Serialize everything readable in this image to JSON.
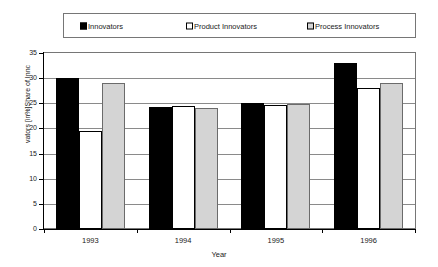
{
  "chart_data": {
    "type": "bar",
    "title": "",
    "xlabel": "Year",
    "ylabel": "vators [in%]Share of Innc",
    "categories": [
      "1993",
      "1994",
      "1995",
      "1996"
    ],
    "series": [
      {
        "name": "Innovators",
        "color": "#000000",
        "values": [
          30.0,
          24.3,
          25.0,
          33.0
        ]
      },
      {
        "name": "Product Innovators",
        "color": "#ffffff",
        "values": [
          19.5,
          24.5,
          24.7,
          28.0
        ]
      },
      {
        "name": "Process Innovators",
        "color": "#d4d4d4",
        "values": [
          29.0,
          24.0,
          24.8,
          29.0
        ]
      }
    ],
    "ylim": [
      0,
      35
    ],
    "yticks": [
      0,
      5,
      10,
      15,
      20,
      25,
      30,
      35
    ],
    "ytick_labels": [
      "0",
      "5",
      "10",
      "15",
      "20",
      "25",
      "30",
      "35"
    ],
    "grid": true,
    "legend_position": "top"
  },
  "legend": {
    "entries": [
      {
        "label": "Innovators"
      },
      {
        "label": "Product Innovators"
      },
      {
        "label": "Process Innovators"
      }
    ]
  },
  "axes": {
    "x_title": "Year",
    "y_title": "vators [in%]Share of Innc"
  }
}
